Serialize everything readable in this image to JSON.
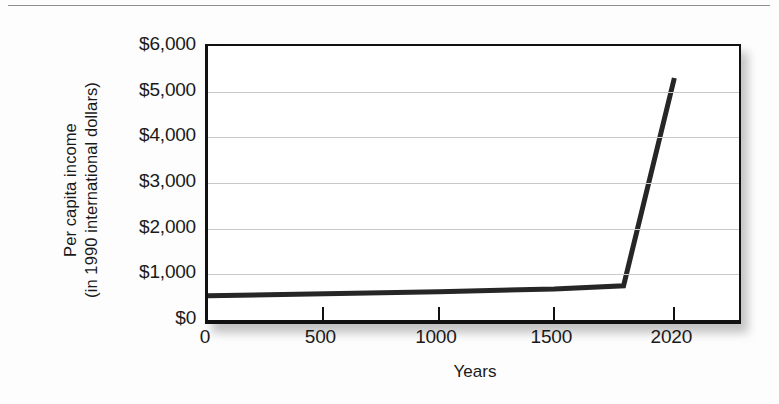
{
  "figure": {
    "background_color": "#fdfdfd",
    "plot_background_color": "#ffffff",
    "frame_color": "#111111",
    "gridline_color": "#c9c9c9",
    "series_color": "#262626"
  },
  "chart_data": {
    "type": "line",
    "title": "",
    "xlabel": "Years",
    "ylabel": "Per capita income (in 1990 international dollars)",
    "ylabel_line1": "Per capita income",
    "ylabel_line2": "(in 1990 international dollars)",
    "xlim": [
      0,
      2300
    ],
    "ylim": [
      0,
      6000
    ],
    "grid": true,
    "legend": false,
    "x_tick_labels": [
      "0",
      "500",
      "1000",
      "1500",
      "2020"
    ],
    "x_tick_values": [
      0,
      500,
      1000,
      1500,
      2020
    ],
    "y_tick_labels": [
      "$6,000",
      "$5,000",
      "$4,000",
      "$3,000",
      "$2,000",
      "$1,000",
      "$0"
    ],
    "y_tick_values": [
      6000,
      5000,
      4000,
      3000,
      2000,
      1000,
      0
    ],
    "series": [
      {
        "name": "Per capita income",
        "x": [
          0,
          1000,
          1500,
          1800,
          2020
        ],
        "values": [
          530,
          620,
          680,
          750,
          5300
        ]
      }
    ]
  }
}
